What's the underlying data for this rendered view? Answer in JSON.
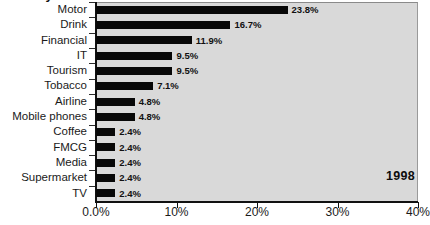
{
  "title_fragment": "industry",
  "annotation": {
    "year_label": "1998"
  },
  "colors": {
    "bar": "#080808",
    "plot_background": "#d9d9d9",
    "axis": "#111111",
    "text": "#1a1a1a"
  },
  "axis": {
    "x_ticks": [
      "0.0%",
      "10%",
      "20%",
      "30%",
      "40%"
    ]
  },
  "chart_data": {
    "type": "bar",
    "orientation": "horizontal",
    "title": "",
    "subtitle": "",
    "xlabel": "",
    "ylabel": "",
    "xlim": [
      0,
      40
    ],
    "xticks": [
      0,
      10,
      20,
      30,
      40
    ],
    "xtick_labels": [
      "0.0%",
      "10%",
      "20%",
      "30%",
      "40%"
    ],
    "grid": false,
    "legend": false,
    "annotations": [
      {
        "text": "1998",
        "position": "bottom-right"
      }
    ],
    "categories": [
      "Motor",
      "Drink",
      "Financial",
      "IT",
      "Tourism",
      "Tobacco",
      "Airline",
      "Mobile phones",
      "Coffee",
      "FMCG",
      "Media",
      "Supermarket",
      "TV"
    ],
    "values": [
      23.8,
      16.7,
      11.9,
      9.5,
      9.5,
      7.1,
      4.8,
      4.8,
      2.4,
      2.4,
      2.4,
      2.4,
      2.4
    ],
    "value_labels": [
      "23.8%",
      "16.7%",
      "11.9%",
      "9.5%",
      "9.5%",
      "7.1%",
      "4.8%",
      "4.8%",
      "2.4%",
      "2.4%",
      "2.4%",
      "2.4%",
      "2.4%"
    ]
  }
}
